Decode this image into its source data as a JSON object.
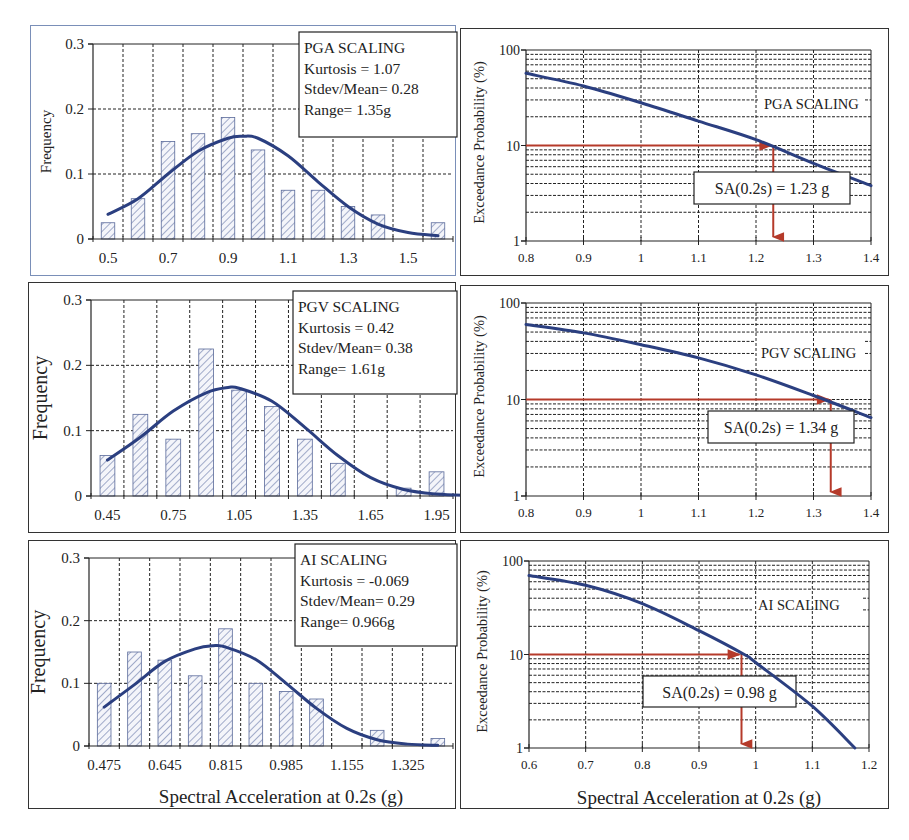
{
  "figure": {
    "shared_xlabel": "Spectral Acceleration at 0.2s (g)",
    "colors": {
      "curve": "#2b3f80",
      "bar_stroke": "#5a6a9a",
      "bar_hatch": "#6878a8",
      "marker": "#b53a2a",
      "grid": "#222222",
      "axis": "#222222"
    }
  },
  "chart_data": [
    {
      "id": "pga-hist",
      "type": "bar",
      "title": "PGA SCALING",
      "stats": [
        "PGA SCALING",
        "Kurtosis = 1.07",
        "Stdev/Mean= 0.28",
        "Range= 1.35g"
      ],
      "xlabel": "",
      "ylabel": "Frequency",
      "ylim": [
        0,
        0.3
      ],
      "yticks": [
        "0",
        "0.1",
        "0.2",
        "0.3"
      ],
      "xticks": [
        "0.5",
        "0.7",
        "0.9",
        "1.1",
        "1.3",
        "1.5"
      ],
      "categories": [
        0.5,
        0.6,
        0.7,
        0.8,
        0.9,
        1.0,
        1.1,
        1.2,
        1.3,
        1.4,
        1.5,
        1.6
      ],
      "values": [
        0.025,
        0.062,
        0.15,
        0.162,
        0.187,
        0.137,
        0.075,
        0.075,
        0.05,
        0.037,
        0.0,
        0.025
      ],
      "fit_curve": {
        "type": "normal",
        "x": [
          0.5,
          0.6,
          0.7,
          0.8,
          0.9,
          0.95,
          1.0,
          1.1,
          1.2,
          1.3,
          1.4,
          1.5,
          1.6
        ],
        "y": [
          0.038,
          0.062,
          0.1,
          0.135,
          0.155,
          0.158,
          0.155,
          0.128,
          0.088,
          0.05,
          0.023,
          0.01,
          0.005
        ]
      }
    },
    {
      "id": "pga-hazard",
      "type": "line",
      "title": "PGA SCALING",
      "xlabel": "",
      "ylabel": "Exceedance  Probability  (%)",
      "yscale": "log",
      "ylim": [
        1,
        100
      ],
      "yticks": [
        "1",
        "10",
        "100"
      ],
      "xlim": [
        0.8,
        1.4
      ],
      "xticks": [
        "0.8",
        "0.9",
        "1",
        "1.1",
        "1.2",
        "1.3",
        "1.4"
      ],
      "series": [
        {
          "name": "exceedance",
          "x": [
            0.8,
            0.9,
            1.0,
            1.1,
            1.2,
            1.3,
            1.4
          ],
          "y": [
            57,
            42,
            28,
            18,
            11.5,
            6.5,
            3.8
          ]
        }
      ],
      "annotation": {
        "label": "SA(0.2s) = 1.23 g",
        "x": 1.23,
        "y": 10
      }
    },
    {
      "id": "pgv-hist",
      "type": "bar",
      "title": "PGV SCALING",
      "stats": [
        "PGV SCALING",
        "Kurtosis = 0.42",
        "Stdev/Mean= 0.38",
        "Range= 1.61g"
      ],
      "xlabel": "",
      "ylabel": "Frequency",
      "ylim": [
        0,
        0.3
      ],
      "yticks": [
        "0",
        "0.1",
        "0.2",
        "0.3"
      ],
      "xticks": [
        "0.45",
        "0.75",
        "1.05",
        "1.35",
        "1.65",
        "1.95"
      ],
      "categories": [
        0.45,
        0.6,
        0.75,
        0.9,
        1.05,
        1.2,
        1.35,
        1.5,
        1.65,
        1.8,
        1.95
      ],
      "values": [
        0.062,
        0.125,
        0.087,
        0.225,
        0.162,
        0.137,
        0.087,
        0.05,
        0.0,
        0.012,
        0.037
      ],
      "fit_curve": {
        "type": "normal",
        "x": [
          0.45,
          0.6,
          0.75,
          0.9,
          1.0,
          1.05,
          1.2,
          1.35,
          1.5,
          1.65,
          1.8,
          1.95,
          2.1
        ],
        "y": [
          0.055,
          0.09,
          0.13,
          0.158,
          0.166,
          0.165,
          0.145,
          0.105,
          0.062,
          0.028,
          0.01,
          0.003,
          0.001
        ]
      }
    },
    {
      "id": "pgv-hazard",
      "type": "line",
      "title": "PGV SCALING",
      "xlabel": "",
      "ylabel": "Exceedance  Probability  (%)",
      "yscale": "log",
      "ylim": [
        1,
        100
      ],
      "yticks": [
        "1",
        "10",
        "100"
      ],
      "xlim": [
        0.8,
        1.4
      ],
      "xticks": [
        "0.8",
        "0.9",
        "1",
        "1.1",
        "1.2",
        "1.3",
        "1.4"
      ],
      "series": [
        {
          "name": "exceedance",
          "x": [
            0.8,
            0.9,
            1.0,
            1.1,
            1.2,
            1.3,
            1.4
          ],
          "y": [
            60,
            49,
            37,
            27,
            18,
            11,
            6.5
          ]
        }
      ],
      "annotation": {
        "label": "SA(0.2s) = 1.34 g",
        "x": 1.33,
        "y": 10
      }
    },
    {
      "id": "ai-hist",
      "type": "bar",
      "title": "AI SCALING",
      "stats": [
        "AI SCALING",
        "Kurtosis = -0.069",
        "Stdev/Mean= 0.29",
        "Range= 0.966g"
      ],
      "xlabel": "Spectral Acceleration at 0.2s (g)",
      "ylabel": "Frequency",
      "ylim": [
        0,
        0.3
      ],
      "yticks": [
        "0",
        "0.1",
        "0.2",
        "0.3"
      ],
      "xticks": [
        "0.475",
        "0.645",
        "0.815",
        "0.985",
        "1.155",
        "1.325"
      ],
      "categories": [
        0.475,
        0.56,
        0.645,
        0.73,
        0.815,
        0.9,
        0.985,
        1.07,
        1.155,
        1.24,
        1.325,
        1.41
      ],
      "values": [
        0.1,
        0.15,
        0.137,
        0.112,
        0.187,
        0.1,
        0.087,
        0.075,
        0.0,
        0.025,
        0.0,
        0.012
      ],
      "fit_curve": {
        "type": "normal",
        "x": [
          0.475,
          0.56,
          0.645,
          0.73,
          0.78,
          0.815,
          0.9,
          0.985,
          1.07,
          1.155,
          1.24,
          1.325,
          1.41
        ],
        "y": [
          0.062,
          0.098,
          0.135,
          0.155,
          0.16,
          0.158,
          0.138,
          0.1,
          0.06,
          0.028,
          0.01,
          0.003,
          0.001
        ]
      }
    },
    {
      "id": "ai-hazard",
      "type": "line",
      "title": "AI SCALING",
      "xlabel": "Spectral Acceleration at 0.2s (g)",
      "ylabel": "Exceedance  Probability  (%)",
      "yscale": "log",
      "ylim": [
        1,
        100
      ],
      "yticks": [
        "1",
        "10",
        "100"
      ],
      "xlim": [
        0.6,
        1.2
      ],
      "xticks": [
        "0.6",
        "0.7",
        "0.8",
        "0.9",
        "1",
        "1.1",
        "1.2"
      ],
      "series": [
        {
          "name": "exceedance",
          "x": [
            0.6,
            0.7,
            0.8,
            0.9,
            0.98,
            1.0,
            1.1,
            1.175
          ],
          "y": [
            70,
            55,
            35,
            18,
            10,
            8.2,
            2.8,
            1.0
          ]
        }
      ],
      "annotation": {
        "label": "SA(0.2s) = 0.98 g",
        "x": 0.975,
        "y": 10
      }
    }
  ]
}
